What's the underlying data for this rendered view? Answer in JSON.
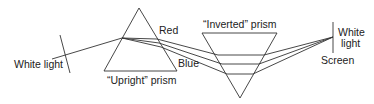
{
  "diagram": {
    "labels": {
      "white_light_source": "White light",
      "red": "Red",
      "blue": "Blue",
      "upright_prism": "“Upright” prism",
      "inverted_prism": "“Inverted” prism",
      "white_light_screen_line1": "White",
      "white_light_screen_line2": "light",
      "screen": "Screen"
    },
    "colors": {
      "line": "#333333",
      "text": "#222222",
      "background": "#ffffff"
    }
  }
}
